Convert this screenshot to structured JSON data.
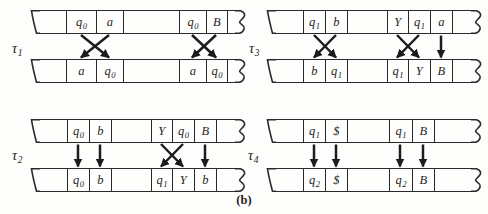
{
  "caption": "(b)",
  "colors": {
    "line": "#2a2a2a",
    "arrow": "#1c1c1c",
    "background": "#fdfdfb"
  },
  "groups": {
    "tau1": {
      "label": {
        "base": "τ",
        "sub": "1"
      },
      "top_cells": [
        {
          "base": "q",
          "sub": "0"
        },
        {
          "base": "a",
          "sub": ""
        },
        {
          "base": "q",
          "sub": "0"
        },
        {
          "base": "B",
          "sub": ""
        }
      ],
      "bottom_cells": [
        {
          "base": "a",
          "sub": ""
        },
        {
          "base": "q",
          "sub": "0"
        },
        {
          "base": "a",
          "sub": ""
        },
        {
          "base": "q",
          "sub": "0"
        }
      ],
      "arrows": [
        [
          0,
          1
        ],
        [
          1,
          0
        ],
        [
          2,
          3
        ],
        [
          3,
          2
        ]
      ]
    },
    "tau2": {
      "label": {
        "base": "τ",
        "sub": "2"
      },
      "top_cells": [
        {
          "base": "q",
          "sub": "0"
        },
        {
          "base": "b",
          "sub": ""
        },
        {
          "base": "Y",
          "sub": ""
        },
        {
          "base": "q",
          "sub": "0"
        },
        {
          "base": "B",
          "sub": ""
        }
      ],
      "bottom_cells": [
        {
          "base": "q",
          "sub": "0"
        },
        {
          "base": "b",
          "sub": ""
        },
        {
          "base": "q",
          "sub": "1"
        },
        {
          "base": "Y",
          "sub": ""
        },
        {
          "base": "b",
          "sub": ""
        }
      ],
      "arrows": [
        [
          0,
          0
        ],
        [
          1,
          1
        ],
        [
          2,
          3
        ],
        [
          3,
          2
        ],
        [
          4,
          4
        ]
      ]
    },
    "tau3": {
      "label": {
        "base": "τ",
        "sub": "3"
      },
      "top_cells": [
        {
          "base": "q",
          "sub": "1"
        },
        {
          "base": "b",
          "sub": ""
        },
        {
          "base": "Y",
          "sub": ""
        },
        {
          "base": "q",
          "sub": "1"
        },
        {
          "base": "a",
          "sub": ""
        }
      ],
      "bottom_cells": [
        {
          "base": "b",
          "sub": ""
        },
        {
          "base": "q",
          "sub": "1"
        },
        {
          "base": "q",
          "sub": "1"
        },
        {
          "base": "Y",
          "sub": ""
        },
        {
          "base": "B",
          "sub": ""
        }
      ],
      "arrows": [
        [
          0,
          1
        ],
        [
          1,
          0
        ],
        [
          2,
          3
        ],
        [
          3,
          2
        ],
        [
          4,
          4
        ]
      ]
    },
    "tau4": {
      "label": {
        "base": "τ",
        "sub": "4"
      },
      "top_cells": [
        {
          "base": "q",
          "sub": "1"
        },
        {
          "base": "$",
          "sub": ""
        },
        {
          "base": "q",
          "sub": "1"
        },
        {
          "base": "B",
          "sub": ""
        }
      ],
      "bottom_cells": [
        {
          "base": "q",
          "sub": "2"
        },
        {
          "base": "$",
          "sub": ""
        },
        {
          "base": "q",
          "sub": "2"
        },
        {
          "base": "B",
          "sub": ""
        }
      ],
      "arrows": [
        [
          0,
          0
        ],
        [
          1,
          1
        ],
        [
          2,
          2
        ],
        [
          3,
          3
        ]
      ]
    }
  }
}
